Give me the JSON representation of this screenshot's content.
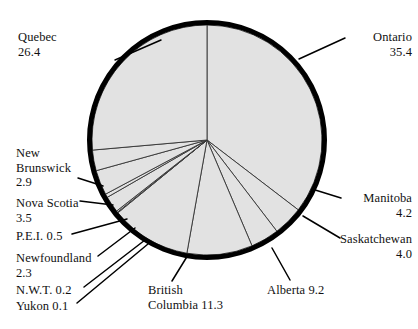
{
  "chart_data": {
    "type": "pie",
    "title": "",
    "subtitle": "",
    "xlabel": "",
    "ylabel": "",
    "legend_position": "none",
    "grid": false,
    "units": "percent",
    "total": 100.0,
    "start_angle_deg": 0,
    "direction": "clockwise",
    "categories": [
      "Ontario",
      "Manitoba",
      "Saskatchewan",
      "Alberta",
      "British Columbia",
      "Yukon",
      "N.W.T.",
      "Newfoundland",
      "P.E.I.",
      "Nova Scotia",
      "New Brunswick",
      "Quebec"
    ],
    "values": [
      35.4,
      4.2,
      4.0,
      9.2,
      11.3,
      0.1,
      0.2,
      2.3,
      0.5,
      3.5,
      2.9,
      26.4
    ],
    "slices": [
      {
        "name": "Ontario",
        "value": 35.4,
        "label_name": "Ontario",
        "label_value": "35.4"
      },
      {
        "name": "Manitoba",
        "value": 4.2,
        "label_name": "Manitoba",
        "label_value": "4.2"
      },
      {
        "name": "Saskatchewan",
        "value": 4.0,
        "label_name": "Saskatchewan",
        "label_value": "4.0"
      },
      {
        "name": "Alberta",
        "value": 9.2,
        "label_name": "Alberta 9.2",
        "label_value": ""
      },
      {
        "name": "British Columbia",
        "value": 11.3,
        "label_name": "British",
        "label_value": "Columbia 11.3"
      },
      {
        "name": "Yukon",
        "value": 0.1,
        "label_name": "Yukon 0.1",
        "label_value": ""
      },
      {
        "name": "N.W.T.",
        "value": 0.2,
        "label_name": "N.W.T. 0.2",
        "label_value": ""
      },
      {
        "name": "Newfoundland",
        "value": 2.3,
        "label_name": "Newfoundland",
        "label_value": "2.3"
      },
      {
        "name": "P.E.I.",
        "value": 0.5,
        "label_name": "P.E.I. 0.5",
        "label_value": ""
      },
      {
        "name": "Nova Scotia",
        "value": 3.5,
        "label_name": "Nova Scotia",
        "label_value": "3.5"
      },
      {
        "name": "New Brunswick",
        "value": 2.9,
        "label_name": "New\nBrunswick",
        "label_value": "2.9"
      },
      {
        "name": "Quebec",
        "value": 26.4,
        "label_name": "Quebec",
        "label_value": "26.4"
      }
    ],
    "colors": {
      "slice_fill": "#e2e2e2",
      "outline": "#000000",
      "divider": "#333333",
      "leader_line": "#000000",
      "text": "#111111",
      "background": "#ffffff"
    }
  },
  "labels": {
    "quebec": {
      "line1": "Quebec",
      "line2": "26.4"
    },
    "ontario": {
      "line1": "Ontario",
      "line2": "35.4"
    },
    "new_brunswick": {
      "line1": "New",
      "line2": "Brunswick",
      "line3": "2.9"
    },
    "nova_scotia": {
      "line1": "Nova Scotia",
      "line2": "3.5"
    },
    "pei": {
      "line1": "P.E.I. 0.5"
    },
    "newfoundland": {
      "line1": "Newfoundland",
      "line2": "2.3"
    },
    "nwt": {
      "line1": "N.W.T. 0.2"
    },
    "yukon": {
      "line1": "Yukon 0.1"
    },
    "manitoba": {
      "line1": "Manitoba",
      "line2": "4.2"
    },
    "saskatchewan": {
      "line1": "Saskatchewan",
      "line2": "4.0"
    },
    "british_columbia": {
      "line1": "British",
      "line2": "Columbia 11.3"
    },
    "alberta": {
      "line1": "Alberta 9.2"
    }
  }
}
